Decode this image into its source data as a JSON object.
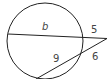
{
  "diagram": {
    "type": "circle-two-secants",
    "colors": {
      "stroke": "#222222",
      "label": "#444444",
      "background": "#ffffff"
    },
    "labels": {
      "top_internal": "b",
      "top_external": "5",
      "bottom_internal": "9",
      "bottom_external": "6"
    }
  }
}
